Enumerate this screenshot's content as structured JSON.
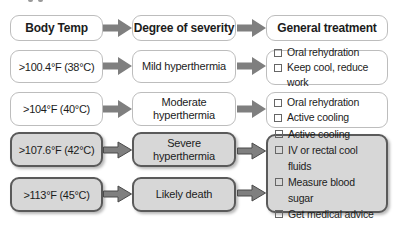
{
  "diagram": {
    "headers": {
      "body_temp": "Body Temp",
      "severity": "Degree of severity",
      "treatment": "General treatment"
    },
    "rows": [
      {
        "temp": ">100.4°F (38°C)",
        "severity": "Mild hyperthermia",
        "treatments": [
          "Oral rehydration",
          "Keep cool, reduce work"
        ]
      },
      {
        "temp": ">104°F (40°C)",
        "severity": "Moderate hyperthermia",
        "treatments": [
          "Oral rehydration",
          "Active cooling"
        ]
      },
      {
        "temp": ">107.6°F (42°C)",
        "severity": "Severe hyperthermia"
      },
      {
        "temp": ">113°F (45°C)",
        "severity": "Likely death"
      }
    ],
    "shared_treatments": [
      "Active cooling",
      "IV or rectal cool fluids",
      "Measure blood sugar",
      "Get medical advice"
    ],
    "colors": {
      "arrow_gray": "#7f7f7f",
      "arrow_outline_dark": "#4a4a4a",
      "box_white": "#ffffff",
      "box_border_light": "#bdbdbd",
      "box_gray_fill": "#d7d7d7",
      "box_gray_border": "#5a5a5a",
      "text": "#1c1c1c"
    }
  }
}
